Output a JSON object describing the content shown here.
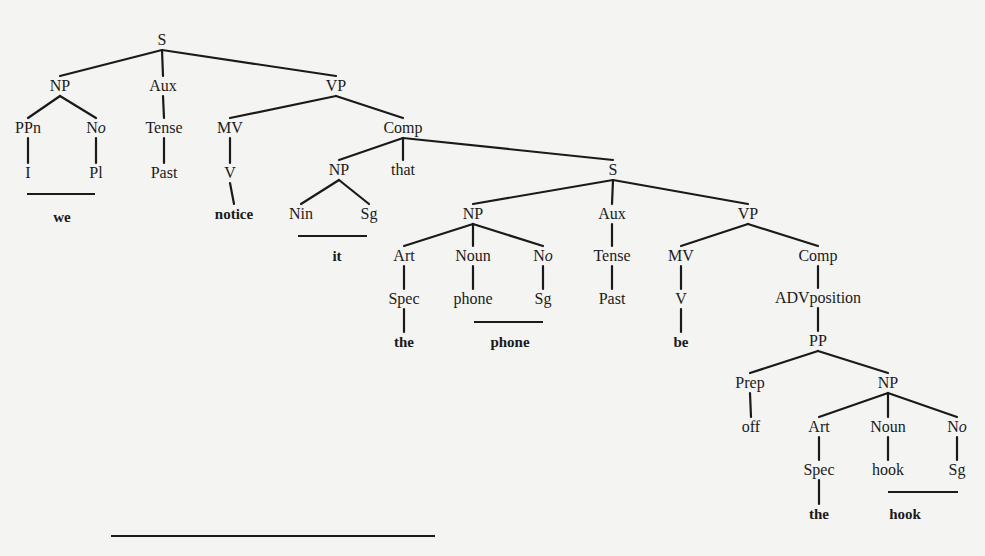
{
  "diagram": {
    "type": "phrase-structure-tree",
    "sentence_words": [
      "we",
      "notice",
      "it",
      "that",
      "the",
      "phone",
      "be",
      "off",
      "the",
      "hook"
    ],
    "nodes": [
      {
        "id": "s1",
        "label": "S",
        "x": 162,
        "y": 40
      },
      {
        "id": "np1",
        "label": "NP",
        "x": 60,
        "y": 86
      },
      {
        "id": "aux1",
        "label": "Aux",
        "x": 163,
        "y": 86
      },
      {
        "id": "vp1",
        "label": "VP",
        "x": 336,
        "y": 86
      },
      {
        "id": "ppn1",
        "label": "PPn",
        "x": 28,
        "y": 128
      },
      {
        "id": "no1",
        "label": "N",
        "label_ital": "o",
        "x": 96,
        "y": 128
      },
      {
        "id": "tense1",
        "label": "Tense",
        "x": 164,
        "y": 128
      },
      {
        "id": "mv1",
        "label": "MV",
        "x": 230,
        "y": 128
      },
      {
        "id": "comp1",
        "label": "Comp",
        "x": 403,
        "y": 128
      },
      {
        "id": "i1",
        "label": "I",
        "x": 28,
        "y": 173
      },
      {
        "id": "pl1",
        "label": "Pl",
        "x": 96,
        "y": 173
      },
      {
        "id": "past1",
        "label": "Past",
        "x": 164,
        "y": 173
      },
      {
        "id": "v1",
        "label": "V",
        "x": 230,
        "y": 173
      },
      {
        "id": "np2",
        "label": "NP",
        "x": 339,
        "y": 170
      },
      {
        "id": "that1",
        "label": "that",
        "x": 403,
        "y": 170
      },
      {
        "id": "s2",
        "label": "S",
        "x": 613,
        "y": 170
      },
      {
        "id": "nin1",
        "label": "Nin",
        "x": 301,
        "y": 214
      },
      {
        "id": "sg1",
        "label": "Sg",
        "x": 369,
        "y": 214
      },
      {
        "id": "np3",
        "label": "NP",
        "x": 473,
        "y": 214
      },
      {
        "id": "aux2",
        "label": "Aux",
        "x": 612,
        "y": 214
      },
      {
        "id": "vp2",
        "label": "VP",
        "x": 748,
        "y": 214
      },
      {
        "id": "art1",
        "label": "Art",
        "x": 404,
        "y": 256
      },
      {
        "id": "noun1",
        "label": "Noun",
        "x": 473,
        "y": 256
      },
      {
        "id": "no2",
        "label": "N",
        "label_ital": "o",
        "x": 543,
        "y": 256
      },
      {
        "id": "tense2",
        "label": "Tense",
        "x": 612,
        "y": 256
      },
      {
        "id": "mv2",
        "label": "MV",
        "x": 681,
        "y": 256
      },
      {
        "id": "comp2",
        "label": "Comp",
        "x": 818,
        "y": 256
      },
      {
        "id": "spec1",
        "label": "Spec",
        "x": 404,
        "y": 299
      },
      {
        "id": "phone1",
        "label": "phone",
        "x": 473,
        "y": 299
      },
      {
        "id": "sg2",
        "label": "Sg",
        "x": 543,
        "y": 299
      },
      {
        "id": "past2",
        "label": "Past",
        "x": 612,
        "y": 299
      },
      {
        "id": "v2",
        "label": "V",
        "x": 681,
        "y": 299
      },
      {
        "id": "advposition1",
        "label": "ADVposition",
        "x": 818,
        "y": 298
      },
      {
        "id": "pp1",
        "label": "PP",
        "x": 818,
        "y": 341
      },
      {
        "id": "prep1",
        "label": "Prep",
        "x": 750,
        "y": 383
      },
      {
        "id": "np4",
        "label": "NP",
        "x": 888,
        "y": 383
      },
      {
        "id": "off1",
        "label": "off",
        "x": 751,
        "y": 427
      },
      {
        "id": "art2",
        "label": "Art",
        "x": 819,
        "y": 427
      },
      {
        "id": "noun2",
        "label": "Noun",
        "x": 888,
        "y": 427
      },
      {
        "id": "no3",
        "label": "N",
        "label_ital": "o",
        "x": 957,
        "y": 427
      },
      {
        "id": "spec2",
        "label": "Spec",
        "x": 819,
        "y": 470
      },
      {
        "id": "hook1",
        "label": "hook",
        "x": 888,
        "y": 470
      },
      {
        "id": "sg3",
        "label": "Sg",
        "x": 957,
        "y": 470
      }
    ],
    "leaves": [
      {
        "id": "we",
        "label": "we",
        "x": 62,
        "y": 217
      },
      {
        "id": "notice",
        "label": "notice",
        "x": 234,
        "y": 214
      },
      {
        "id": "it",
        "label": "it",
        "x": 337,
        "y": 256
      },
      {
        "id": "the1",
        "label": "the",
        "x": 404,
        "y": 342
      },
      {
        "id": "phone2",
        "label": "phone",
        "x": 510,
        "y": 342
      },
      {
        "id": "be",
        "label": "be",
        "x": 681,
        "y": 342
      },
      {
        "id": "the2",
        "label": "the",
        "x": 819,
        "y": 514
      },
      {
        "id": "hook2",
        "label": "hook",
        "x": 905,
        "y": 514
      }
    ],
    "edges": [
      [
        "s1",
        "np1"
      ],
      [
        "s1",
        "aux1"
      ],
      [
        "s1",
        "vp1"
      ],
      [
        "np1",
        "ppn1"
      ],
      [
        "np1",
        "no1"
      ],
      [
        "aux1",
        "tense1"
      ],
      [
        "vp1",
        "mv1"
      ],
      [
        "vp1",
        "comp1"
      ],
      [
        "ppn1",
        "i1"
      ],
      [
        "no1",
        "pl1"
      ],
      [
        "tense1",
        "past1"
      ],
      [
        "mv1",
        "v1"
      ],
      [
        "v1",
        "notice"
      ],
      [
        "comp1",
        "np2"
      ],
      [
        "comp1",
        "that1"
      ],
      [
        "comp1",
        "s2"
      ],
      [
        "np2",
        "nin1"
      ],
      [
        "np2",
        "sg1"
      ],
      [
        "s2",
        "np3"
      ],
      [
        "s2",
        "aux2"
      ],
      [
        "s2",
        "vp2"
      ],
      [
        "np3",
        "art1"
      ],
      [
        "np3",
        "noun1"
      ],
      [
        "np3",
        "no2"
      ],
      [
        "aux2",
        "tense2"
      ],
      [
        "vp2",
        "mv2"
      ],
      [
        "vp2",
        "comp2"
      ],
      [
        "art1",
        "spec1"
      ],
      [
        "noun1",
        "phone1"
      ],
      [
        "no2",
        "sg2"
      ],
      [
        "tense2",
        "past2"
      ],
      [
        "mv2",
        "v2"
      ],
      [
        "spec1",
        "the1"
      ],
      [
        "v2",
        "be"
      ],
      [
        "comp2",
        "advposition1"
      ],
      [
        "advposition1",
        "pp1"
      ],
      [
        "pp1",
        "prep1"
      ],
      [
        "pp1",
        "np4"
      ],
      [
        "prep1",
        "off1"
      ],
      [
        "np4",
        "art2"
      ],
      [
        "np4",
        "noun2"
      ],
      [
        "np4",
        "no3"
      ],
      [
        "art2",
        "spec2"
      ],
      [
        "noun2",
        "hook1"
      ],
      [
        "no3",
        "sg3"
      ],
      [
        "spec2",
        "the2"
      ]
    ],
    "merge_bars": [
      {
        "label": "I + Pl → we",
        "x1": 27,
        "x2": 95,
        "y": 193
      },
      {
        "label": "Nin + Sg → it",
        "x1": 298,
        "x2": 367,
        "y": 235
      },
      {
        "label": "phone + Sg → phone",
        "x1": 474,
        "x2": 543,
        "y": 321
      },
      {
        "label": "hook + Sg → hook",
        "x1": 888,
        "x2": 958,
        "y": 491
      },
      {
        "label": "bottom bar",
        "x1": 111,
        "x2": 435,
        "y": 535
      }
    ]
  }
}
